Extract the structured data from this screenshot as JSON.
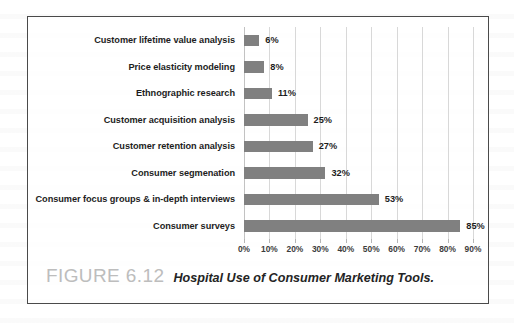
{
  "figure": {
    "number_label": "FIGURE 6.12",
    "caption": "Hospital Use of Consumer Marketing Tools."
  },
  "chart_data": {
    "type": "bar",
    "orientation": "horizontal",
    "title": "Hospital Use of Consumer Marketing Tools.",
    "xlabel": "",
    "ylabel": "",
    "xlim": [
      0,
      90
    ],
    "grid": true,
    "legend": false,
    "bar_color": "#808080",
    "categories": [
      "Customer lifetime value analysis",
      "Price elasticity modeling",
      "Ethnographic research",
      "Customer acquisition analysis",
      "Customer retention analysis",
      "Consumer segmenation",
      "Consumer focus groups & in-depth interviews",
      "Consumer surveys"
    ],
    "values": [
      6,
      8,
      11,
      25,
      27,
      32,
      53,
      85
    ],
    "value_labels": [
      "6%",
      "8%",
      "11%",
      "25%",
      "27%",
      "32%",
      "53%",
      "85%"
    ],
    "tick_values": [
      0,
      10,
      20,
      30,
      40,
      50,
      60,
      70,
      80,
      90
    ],
    "tick_labels": [
      "0%",
      "10%",
      "20%",
      "30%",
      "40%",
      "50%",
      "60%",
      "70%",
      "80%",
      "90%"
    ]
  }
}
